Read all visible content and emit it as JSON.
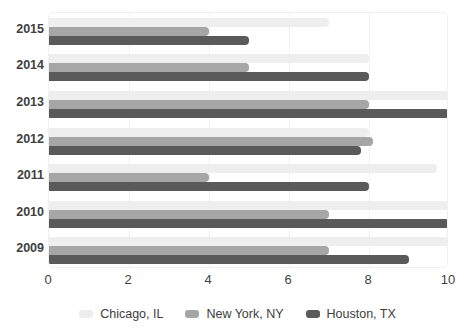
{
  "chart_data": {
    "type": "bar",
    "orientation": "horizontal",
    "title": "",
    "xlabel": "",
    "ylabel": "",
    "categories": [
      "2015",
      "2014",
      "2013",
      "2012",
      "2011",
      "2010",
      "2009"
    ],
    "series": [
      {
        "name": "Chicago, IL",
        "color": "#eeeeee",
        "values": [
          7,
          8,
          10,
          8,
          9.7,
          10,
          10
        ]
      },
      {
        "name": "New York, NY",
        "color": "#a6a6a6",
        "values": [
          4,
          5,
          8,
          8.1,
          4,
          7,
          7
        ]
      },
      {
        "name": "Houston, TX",
        "color": "#5a5a5a",
        "values": [
          5,
          8,
          10,
          7.8,
          8,
          10,
          9
        ]
      }
    ],
    "xlim": [
      0,
      10
    ],
    "xticks": [
      "0",
      "2",
      "4",
      "6",
      "8",
      "10"
    ],
    "xtick_values": [
      0,
      2,
      4,
      6,
      8,
      10
    ],
    "grid": true,
    "legend_position": "bottom"
  },
  "legend": {
    "items": [
      {
        "label": "Chicago, IL",
        "color": "#eeeeee"
      },
      {
        "label": "New York, NY",
        "color": "#a6a6a6"
      },
      {
        "label": "Houston, TX",
        "color": "#5a5a5a"
      }
    ]
  },
  "colors": {
    "series_1": "#eeeeee",
    "series_2": "#a6a6a6",
    "series_3": "#5a5a5a",
    "gridline": "#f1f1f3",
    "plot_border": "#f0f0f2",
    "text": "#3f3f3f",
    "background": "#ffffff"
  }
}
